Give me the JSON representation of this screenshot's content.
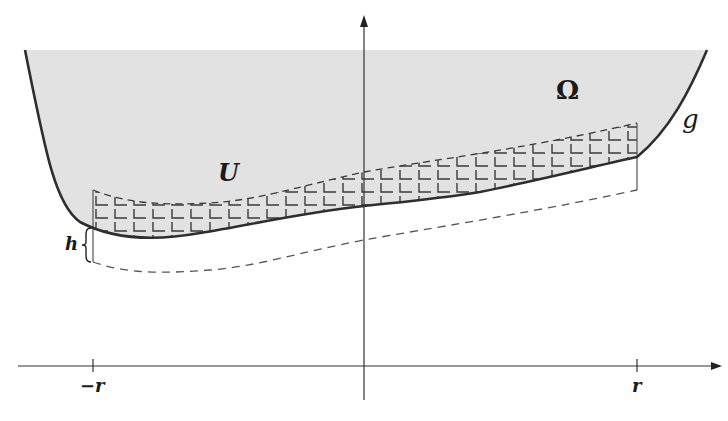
{
  "figure": {
    "type": "mathematical-diagram",
    "labels": {
      "domain": "Ω",
      "subset": "U",
      "graph": "g",
      "shift": "h",
      "tick_left": "−r",
      "tick_right": "r"
    },
    "colors": {
      "background": "#ffffff",
      "region_fill": "#e2e2e2",
      "curve": "#2e2e2e",
      "axis": "#333333",
      "hatch": "#3a3a3a",
      "dashed": "#555555"
    },
    "axes": {
      "x_axis": {
        "y": 366,
        "x_start": 18,
        "x_end": 720,
        "arrow": true
      },
      "y_axis": {
        "x": 364,
        "y_start": 400,
        "y_end": 17,
        "arrow": true
      },
      "ticks": [
        {
          "label": "−r",
          "x": 93
        },
        {
          "label": "r",
          "x": 637
        }
      ]
    }
  }
}
